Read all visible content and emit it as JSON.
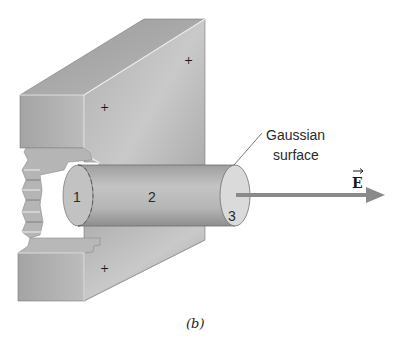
{
  "figure": {
    "caption": "(b)",
    "callout": {
      "line1": "Gaussian",
      "line2": "surface"
    },
    "field_label": "E",
    "regions": [
      "1",
      "2",
      "3"
    ],
    "charges": [
      "+",
      "+",
      "+"
    ],
    "colors": {
      "slab_light": "#c8c8c8",
      "slab_mid": "#a9a9a9",
      "slab_dark": "#8c8c8c",
      "cylinder": "#b4b4b4",
      "cap": "#dcdcdc",
      "arrow": "#8a8a8a",
      "background": "#ffffff"
    }
  }
}
